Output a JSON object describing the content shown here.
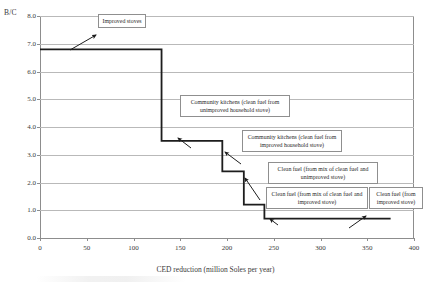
{
  "chart_data": {
    "type": "line",
    "subtype": "step-marginal-abatement-cost-curve",
    "title": "",
    "xlabel": "CED reduction (million Soles per year)",
    "ylabel": "B/C",
    "xlim": [
      0,
      400
    ],
    "ylim": [
      0,
      8
    ],
    "grid": true,
    "legend_position": "none",
    "xticks": [
      "0",
      "50",
      "100",
      "150",
      "200",
      "250",
      "300",
      "350",
      "400"
    ],
    "xtick_values": [
      0,
      50,
      100,
      150,
      200,
      250,
      300,
      350,
      400
    ],
    "yticks": [
      "0.0",
      "1.0",
      "2.0",
      "3.0",
      "4.0",
      "5.0",
      "6.0",
      "7.0",
      "8.0"
    ],
    "ytick_values": [
      0,
      1,
      2,
      3,
      4,
      5,
      6,
      7,
      8
    ],
    "steps": [
      {
        "label": "Improved stoves",
        "x_start": 0,
        "x_end": 130,
        "width": 130,
        "value": 6.8
      },
      {
        "label": "Community kitchens (clean fuel from unimproved household stove)",
        "x_start": 130,
        "x_end": 195,
        "width": 65,
        "value": 3.5
      },
      {
        "label": "Community kitchens (clean fuel from improved household stove)",
        "x_start": 195,
        "x_end": 218,
        "width": 23,
        "value": 2.4
      },
      {
        "label": "Clean fuel (from mix of clean fuel and unimproved stove)",
        "x_start": 218,
        "x_end": 240,
        "width": 22,
        "value": 1.2
      },
      {
        "label": "Clean fuel (from mix of clean fuel and improved stove)",
        "x_start": 240,
        "x_end": 375,
        "width": 135,
        "value": 0.7
      },
      {
        "label": "Clean fuel (from improved stove)",
        "x_start": 240,
        "x_end": 375,
        "width": 135,
        "value": 0.7
      }
    ],
    "series": [
      {
        "name": "B/C ratio",
        "x": [
          0,
          130,
          130,
          195,
          195,
          218,
          218,
          240,
          240,
          375
        ],
        "y": [
          6.8,
          6.8,
          3.5,
          3.5,
          2.4,
          2.4,
          1.2,
          1.2,
          0.7,
          0.7
        ]
      }
    ]
  },
  "annotations": [
    {
      "id": "improved-stoves",
      "text": "Improved stoves"
    },
    {
      "id": "community-kitchens-unimproved",
      "text": "Community kitchens (clean fuel from unimproved household stove)"
    },
    {
      "id": "community-kitchens-improved",
      "text": "Community kitchens (clean fuel from improved household stove)"
    },
    {
      "id": "clean-fuel-mix-unimproved",
      "text": "Clean fuel (from mix of clean fuel and unimproved stove)"
    },
    {
      "id": "clean-fuel-mix-improved",
      "text": "Clean fuel (from mix of clean fuel and improved stove)"
    },
    {
      "id": "clean-fuel-improved",
      "text": "Clean fuel (from improved stove)"
    }
  ],
  "colors": {
    "curve": "#1d1d1d",
    "grid": "#b9b9b9",
    "frame": "#8d8d8d",
    "callout_border": "#8f8f8f",
    "text": "#2b2b2b"
  }
}
